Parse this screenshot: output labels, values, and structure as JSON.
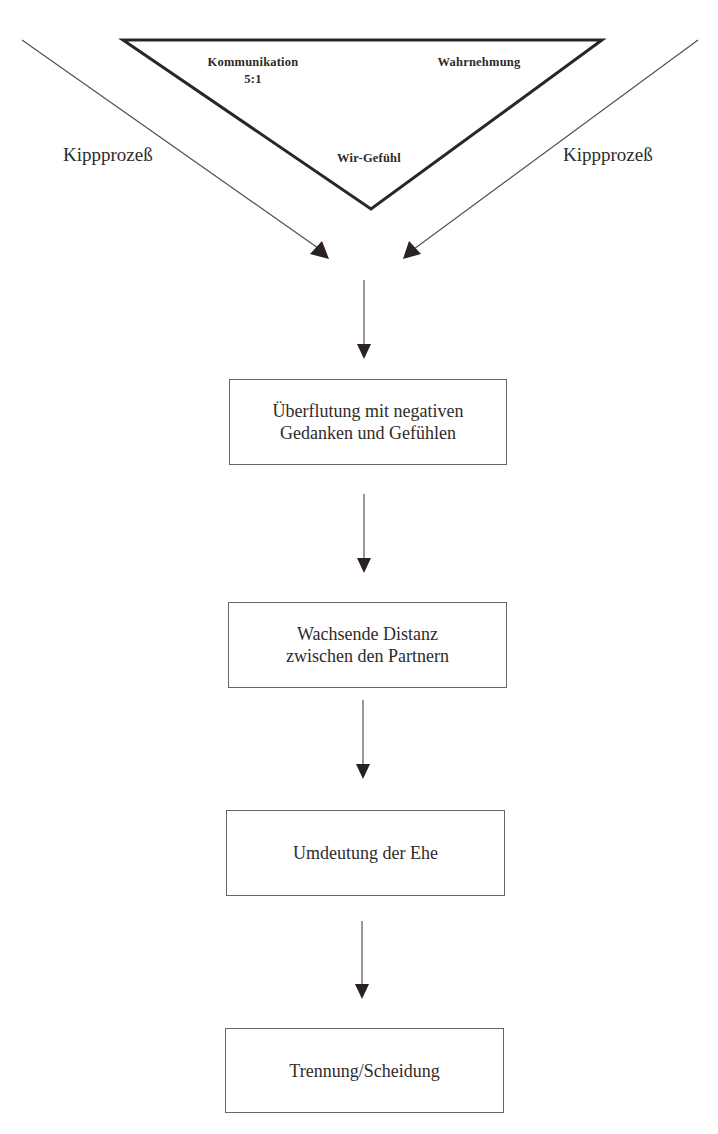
{
  "diagram": {
    "type": "flowchart",
    "cutoff_heading_fragment": "",
    "triangle": {
      "labels": {
        "top_left": "Kommunikation",
        "top_left_ratio": "5:1",
        "top_right": "Wahrnehmung",
        "bottom": "Wir-Gefühl"
      }
    },
    "side_labels": {
      "left": "Kippprozeß",
      "right": "Kippprozeß"
    },
    "steps": [
      {
        "line1": "Überflutung mit negativen",
        "line2": "Gedanken und Gefühlen"
      },
      {
        "line1": "Wachsende Distanz",
        "line2": "zwischen den Partnern"
      },
      {
        "line1": "Umdeutung der Ehe"
      },
      {
        "line1": "Trennung/Scheidung"
      }
    ],
    "colors": {
      "stroke": "#2a2626",
      "thin_stroke": "#555050",
      "background": "#ffffff"
    }
  }
}
